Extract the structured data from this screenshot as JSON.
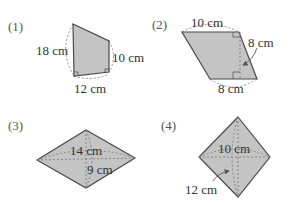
{
  "figures": [
    {
      "number": "(1)",
      "shape": "trapezoid",
      "labels": {
        "left": "18 cm",
        "right": "10 cm",
        "bottom": "12 cm"
      }
    },
    {
      "number": "(2)",
      "shape": "parallelogram",
      "labels": {
        "top": "10 cm",
        "height": "8 cm",
        "bottom": "8 cm"
      }
    },
    {
      "number": "(3)",
      "shape": "rhombus",
      "labels": {
        "horizontal_diagonal": "14 cm",
        "vertical_diagonal": "9 cm"
      }
    },
    {
      "number": "(4)",
      "shape": "square-rhombus",
      "labels": {
        "horizontal_diagonal": "10 cm",
        "vertical_diagonal": "12 cm"
      }
    }
  ],
  "colors": {
    "fill": "#c4c4c4",
    "stroke": "#4a4a4a",
    "text": "#333333"
  }
}
